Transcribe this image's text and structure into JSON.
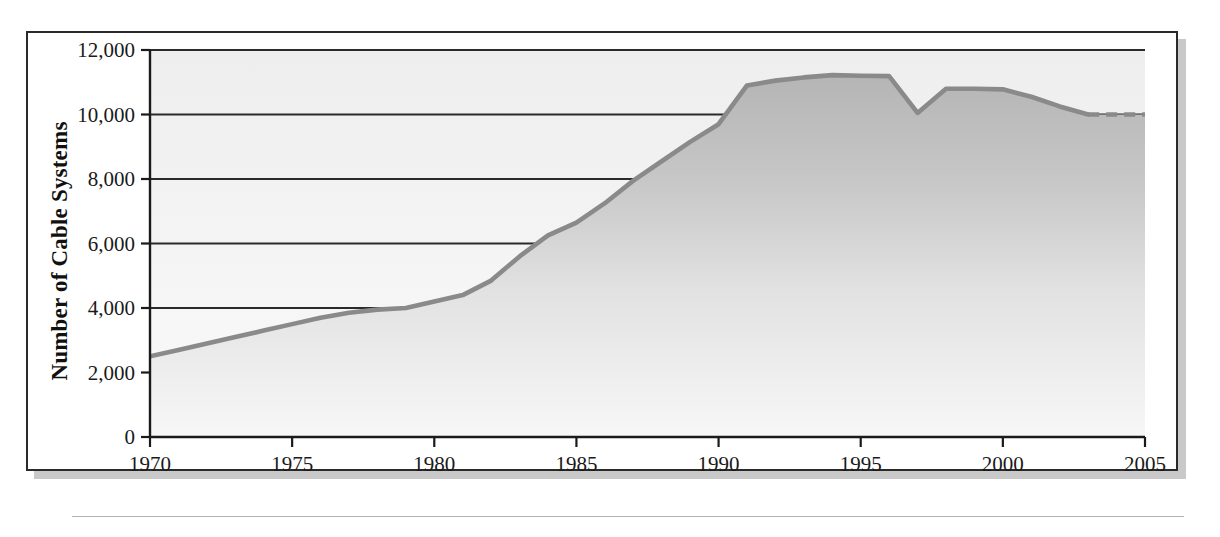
{
  "chart_data": {
    "type": "area",
    "title": "",
    "xlabel": "",
    "ylabel": "Number of Cable Systems",
    "xlim": [
      1970,
      2005
    ],
    "ylim": [
      0,
      12000
    ],
    "grid": true,
    "legend": null,
    "xticks": [
      "1970",
      "1975",
      "1980",
      "1985",
      "1990",
      "1995",
      "2000",
      "2005"
    ],
    "xtick_values": [
      1970,
      1975,
      1980,
      1985,
      1990,
      1995,
      2000,
      2005
    ],
    "ytick_values": [
      0,
      2000,
      4000,
      6000,
      8000,
      10000,
      12000
    ],
    "yticks": [
      "0",
      "2,000",
      "4,000",
      "6,000",
      "8,000",
      "10,000",
      "12,000"
    ],
    "gridline_values": [
      2000,
      4000,
      6000,
      8000,
      10000,
      12000
    ],
    "series": [
      {
        "name": "Number of Cable Systems",
        "x": [
          1970,
          1971,
          1972,
          1973,
          1974,
          1975,
          1976,
          1977,
          1978,
          1979,
          1980,
          1981,
          1982,
          1983,
          1984,
          1985,
          1986,
          1987,
          1988,
          1989,
          1990,
          1991,
          1992,
          1993,
          1994,
          1995,
          1996,
          1997,
          1998,
          1999,
          2000,
          2001,
          2002,
          2003,
          2004,
          2005
        ],
        "values": [
          2500,
          2700,
          2900,
          3100,
          3300,
          3500,
          3700,
          3850,
          3950,
          4000,
          4200,
          4400,
          4850,
          5600,
          6250,
          6650,
          7250,
          7950,
          8550,
          9150,
          9700,
          10900,
          11050,
          11150,
          11220,
          11200,
          11190,
          10050,
          10800,
          10800,
          10780,
          10550,
          10250,
          10000,
          10000,
          10000
        ],
        "projected_from": 2003,
        "projected_style": "dashed"
      }
    ],
    "annotations": [
      {
        "label": "peak",
        "x": 1994,
        "y": 11220
      },
      {
        "label": "dip",
        "x": 1997,
        "y": 10050
      }
    ],
    "colors": {
      "line": "#8a8a8a",
      "line_dark": "#707070",
      "area_top": "#b9b9b9",
      "area_bottom": "#f4f4f4",
      "plot_background": "#f0f0f0",
      "axis": "#1a1a1a",
      "grid": "#2a2a2a",
      "frame": "#2a2a2a",
      "shadow": "#c9c9c9"
    }
  }
}
